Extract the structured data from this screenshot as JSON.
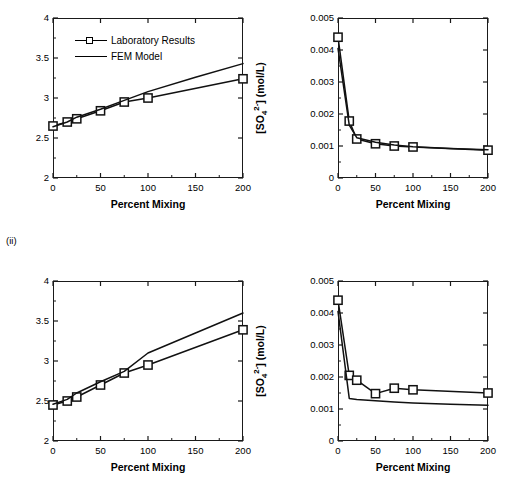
{
  "figure": {
    "row_labels": [
      {
        "id": "row-ii",
        "text": "(ii)"
      }
    ],
    "legend": {
      "entries": [
        {
          "label": "Laboratory Results",
          "style": "line-with-open-square-marker",
          "color": "#000000"
        },
        {
          "label": "FEM Model",
          "style": "plain-line",
          "color": "#000000"
        }
      ]
    }
  },
  "chart_data": [
    {
      "id": "chart-i-ph",
      "type": "line",
      "panel": "top-left",
      "title": "",
      "xlabel": "Percent Mixing",
      "ylabel": "pH",
      "xlim": [
        0,
        200
      ],
      "ylim": [
        2,
        4
      ],
      "xticks": [
        0,
        50,
        100,
        150,
        200
      ],
      "xticklabels": [
        "0",
        "50",
        "100",
        "150",
        "200"
      ],
      "yticks": [
        2,
        2.5,
        3,
        3.5,
        4
      ],
      "yticklabels": [
        "2",
        "2.5",
        "3",
        "3.5",
        "4"
      ],
      "xminorticks": [
        25,
        75,
        125,
        175
      ],
      "yminorticks": [
        2.25,
        2.75,
        3.25,
        3.75
      ],
      "grid": false,
      "legend_position": "upper-left-inside",
      "series": [
        {
          "name": "Laboratory Results",
          "marker": "open-square",
          "x": [
            0,
            15,
            25,
            50,
            75,
            100,
            200
          ],
          "values": [
            2.65,
            2.7,
            2.74,
            2.84,
            2.95,
            3.0,
            3.24
          ]
        },
        {
          "name": "FEM Model",
          "marker": "none",
          "x": [
            0,
            15,
            25,
            50,
            75,
            100,
            150,
            200
          ],
          "values": [
            2.64,
            2.7,
            2.76,
            2.86,
            2.97,
            3.08,
            3.26,
            3.43
          ]
        }
      ]
    },
    {
      "id": "chart-i-sulfate",
      "type": "line",
      "panel": "top-right",
      "title": "",
      "xlabel": "Percent Mixing",
      "ylabel": "[SO4 2-] (mol/L)",
      "ylabel_parts": {
        "prefix": "[SO",
        "sub": "4",
        "sup": "2-",
        "suffix": "] (mol/L)"
      },
      "xlim": [
        0,
        200
      ],
      "ylim": [
        0,
        0.005
      ],
      "xticks": [
        0,
        50,
        100,
        150,
        200
      ],
      "xticklabels": [
        "0",
        "50",
        "100",
        "150",
        "200"
      ],
      "yticks": [
        0,
        0.001,
        0.002,
        0.003,
        0.004,
        0.005
      ],
      "yticklabels": [
        "0",
        "0.001",
        "0.002",
        "0.003",
        "0.004",
        "0.005"
      ],
      "xminorticks": [
        25,
        75,
        125,
        175
      ],
      "yminorticks": [
        0.0005,
        0.0015,
        0.0025,
        0.0035,
        0.0045
      ],
      "grid": false,
      "legend_position": "none",
      "series": [
        {
          "name": "Laboratory Results",
          "marker": "open-square",
          "x": [
            0,
            15,
            25,
            50,
            75,
            100,
            200
          ],
          "values": [
            0.0044,
            0.00178,
            0.00122,
            0.00107,
            0.001,
            0.00097,
            0.00087
          ]
        },
        {
          "name": "FEM Model",
          "marker": "none",
          "x": [
            0,
            15,
            25,
            50,
            75,
            100,
            150,
            200
          ],
          "values": [
            0.00405,
            0.00165,
            0.00126,
            0.00112,
            0.00103,
            0.00098,
            0.00092,
            0.00088
          ]
        }
      ]
    },
    {
      "id": "chart-ii-ph",
      "type": "line",
      "panel": "bottom-left",
      "title": "",
      "xlabel": "Percent Mixing",
      "ylabel": "pH",
      "xlim": [
        0,
        200
      ],
      "ylim": [
        2,
        4
      ],
      "xticks": [
        0,
        50,
        100,
        150,
        200
      ],
      "xticklabels": [
        "0",
        "50",
        "100",
        "150",
        "200"
      ],
      "yticks": [
        2,
        2.5,
        3,
        3.5,
        4
      ],
      "yticklabels": [
        "2",
        "2.5",
        "3",
        "3.5",
        "4"
      ],
      "xminorticks": [
        25,
        75,
        125,
        175
      ],
      "yminorticks": [
        2.25,
        2.75,
        3.25,
        3.75
      ],
      "grid": false,
      "legend_position": "none",
      "series": [
        {
          "name": "Laboratory Results",
          "marker": "open-square",
          "x": [
            0,
            15,
            25,
            50,
            75,
            100,
            200
          ],
          "values": [
            2.45,
            2.5,
            2.55,
            2.7,
            2.85,
            2.95,
            3.39
          ]
        },
        {
          "name": "FEM Model",
          "marker": "none",
          "x": [
            0,
            15,
            25,
            50,
            75,
            100,
            150,
            200
          ],
          "values": [
            2.46,
            2.52,
            2.6,
            2.74,
            2.87,
            3.1,
            3.35,
            3.6
          ]
        }
      ]
    },
    {
      "id": "chart-ii-sulfate",
      "type": "line",
      "panel": "bottom-right",
      "title": "",
      "xlabel": "Percent Mixing",
      "ylabel": "[SO4 2-] (mol/L)",
      "ylabel_parts": {
        "prefix": "[SO",
        "sub": "4",
        "sup": "2-",
        "suffix": "] (mol/L)"
      },
      "xlim": [
        0,
        200
      ],
      "ylim": [
        0,
        0.005
      ],
      "xticks": [
        0,
        50,
        100,
        150,
        200
      ],
      "xticklabels": [
        "0",
        "50",
        "100",
        "150",
        "200"
      ],
      "yticks": [
        0,
        0.001,
        0.002,
        0.003,
        0.004,
        0.005
      ],
      "yticklabels": [
        "0",
        "0.001",
        "0.002",
        "0.003",
        "0.004",
        "0.005"
      ],
      "xminorticks": [
        25,
        75,
        125,
        175
      ],
      "yminorticks": [
        0.0005,
        0.0015,
        0.0025,
        0.0035,
        0.0045
      ],
      "grid": false,
      "legend_position": "none",
      "series": [
        {
          "name": "Laboratory Results",
          "marker": "open-square",
          "x": [
            0,
            15,
            25,
            50,
            75,
            100,
            200
          ],
          "values": [
            0.0044,
            0.00205,
            0.0019,
            0.00148,
            0.00165,
            0.0016,
            0.0015
          ]
        },
        {
          "name": "FEM Model",
          "marker": "none",
          "x": [
            0,
            15,
            25,
            50,
            75,
            100,
            150,
            200
          ],
          "values": [
            0.00405,
            0.00133,
            0.0013,
            0.00126,
            0.00122,
            0.00119,
            0.00115,
            0.00112
          ]
        }
      ]
    }
  ]
}
